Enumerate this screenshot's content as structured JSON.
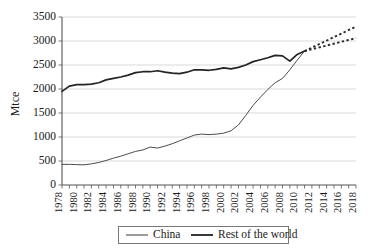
{
  "chart_data": {
    "type": "line",
    "title": "",
    "xlabel": "",
    "ylabel": "Mtce",
    "ylim": [
      0,
      3500
    ],
    "ytick_values": [
      0,
      500,
      1000,
      1500,
      2000,
      2500,
      3000,
      3500
    ],
    "ytick_labels": [
      "0",
      "500",
      "1000",
      "1500",
      "2000",
      "2500",
      "3000",
      "3500"
    ],
    "xlim": [
      1978,
      2018
    ],
    "xtick_labels": [
      "1978",
      "1980",
      "1982",
      "1984",
      "1986",
      "1988",
      "1990",
      "1992",
      "1994",
      "1996",
      "1998",
      "2000",
      "2002",
      "2004",
      "2006",
      "2008",
      "2010",
      "2012",
      "2014",
      "2016",
      "2018"
    ],
    "grid": "horizontal",
    "legend_position": "bottom-center",
    "x": [
      1978,
      1979,
      1980,
      1981,
      1982,
      1983,
      1984,
      1985,
      1986,
      1987,
      1988,
      1989,
      1990,
      1991,
      1992,
      1993,
      1994,
      1995,
      1996,
      1997,
      1998,
      1999,
      2000,
      2001,
      2002,
      2003,
      2004,
      2005,
      2006,
      2007,
      2008,
      2009,
      2010,
      2011
    ],
    "series": [
      {
        "name": "China",
        "style": "solid-thin",
        "values": [
          430,
          430,
          425,
          420,
          440,
          470,
          510,
          560,
          600,
          650,
          700,
          730,
          790,
          770,
          810,
          860,
          920,
          980,
          1040,
          1060,
          1050,
          1060,
          1080,
          1130,
          1250,
          1450,
          1660,
          1830,
          1990,
          2130,
          2220,
          2400,
          2600,
          2790
        ]
      },
      {
        "name": "Rest of the world",
        "style": "solid-thick",
        "values": [
          1950,
          2060,
          2090,
          2090,
          2100,
          2130,
          2190,
          2220,
          2250,
          2290,
          2340,
          2360,
          2360,
          2380,
          2350,
          2330,
          2320,
          2350,
          2400,
          2400,
          2390,
          2410,
          2440,
          2420,
          2450,
          2500,
          2570,
          2610,
          2650,
          2700,
          2690,
          2580,
          2720,
          2790
        ]
      }
    ],
    "projections": [
      {
        "name": "China projection",
        "style": "dashed",
        "x": [
          2011,
          2018
        ],
        "values": [
          2790,
          3300
        ]
      },
      {
        "name": "Rest of the world projection",
        "style": "dashed",
        "x": [
          2011,
          2018
        ],
        "values": [
          2790,
          3060
        ]
      }
    ],
    "legend": [
      {
        "label": "China",
        "style": "solid-thin"
      },
      {
        "label": "Rest of the world",
        "style": "solid-thick"
      }
    ],
    "colors": {
      "china_line": "#4c4c4c",
      "row_line": "#232323",
      "projection_line": "#2b2b2b",
      "gridline": "#c9c9c9",
      "axis": "#555555",
      "background": "#ffffff",
      "text": "#1a1a1a"
    }
  }
}
